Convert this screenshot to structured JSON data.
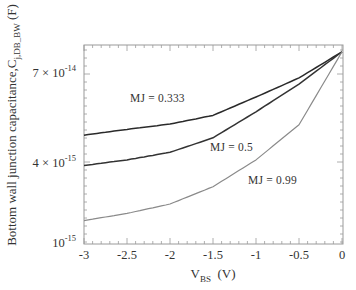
{
  "chart_data": {
    "type": "line",
    "title": "",
    "xlabel": "V_BS (V)",
    "xlabel_main": "V",
    "xlabel_sub": "BS",
    "xlabel_unit": "(V)",
    "ylabel": "Bottom wall junction capacitance,C_j,DB_BW (F)",
    "ylabel_main": "Bottom wall junction capacitance,C",
    "ylabel_sub": "j,DB_BW",
    "ylabel_unit": "(F)",
    "xlim": [
      -3,
      0
    ],
    "yscale": "log",
    "ylim": [
      1e-15,
      3.2e-14
    ],
    "grid": false,
    "legend": "inline labels",
    "x_ticks": [
      "-3",
      "-2.5",
      "-2",
      "-1.5",
      "-1",
      "-0.5",
      "0"
    ],
    "y_ticks": [
      {
        "mantissa": "7 ×",
        "base": "10",
        "exp": "-14"
      },
      {
        "mantissa": "4 ×",
        "base": "10",
        "exp": "-15"
      },
      {
        "mantissa": "",
        "base": "10",
        "exp": "-15"
      }
    ],
    "x": [
      -3,
      -2.5,
      -2,
      -1.5,
      -1,
      -0.5,
      0
    ],
    "series": [
      {
        "name": "MJ = 0.333",
        "color": "#2a2a2a",
        "values": [
          6.6e-15,
          7.3e-15,
          8e-15,
          9.3e-15,
          1.28e-14,
          1.78e-14,
          2.8e-14
        ]
      },
      {
        "name": "MJ = 0.5",
        "color": "#333333",
        "values": [
          3.9e-15,
          4.3e-15,
          4.9e-15,
          6.3e-15,
          9.9e-15,
          1.6e-14,
          2.8e-14
        ]
      },
      {
        "name": "MJ = 0.99",
        "color": "#8a8a8a",
        "values": [
          1.5e-15,
          1.7e-15,
          2e-15,
          2.7e-15,
          4.3e-15,
          7.9e-15,
          2.8e-14
        ]
      }
    ]
  },
  "labels": {
    "series_0": "MJ = 0.333",
    "series_1": "MJ = 0.5",
    "series_2": "MJ = 0.99"
  }
}
